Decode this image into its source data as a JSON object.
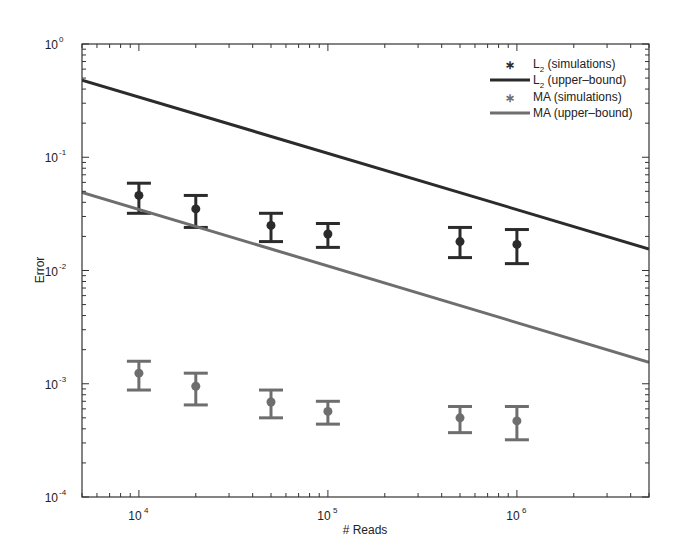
{
  "chart_data": {
    "type": "scatter",
    "title": "",
    "xlabel": "# Reads",
    "ylabel": "Error",
    "xscale": "log",
    "yscale": "log",
    "xlim": [
      5000,
      5000000
    ],
    "ylim": [
      0.0001,
      1
    ],
    "grid": false,
    "legend_position": "upper right",
    "x_ticks": [
      {
        "value": 10000,
        "base": "10",
        "exp": "4"
      },
      {
        "value": 100000,
        "base": "10",
        "exp": "5"
      },
      {
        "value": 1000000,
        "base": "10",
        "exp": "6"
      }
    ],
    "y_ticks": [
      {
        "value": 1,
        "base": "10",
        "exp": "0"
      },
      {
        "value": 0.1,
        "base": "10",
        "exp": "-1"
      },
      {
        "value": 0.01,
        "base": "10",
        "exp": "-2"
      },
      {
        "value": 0.001,
        "base": "10",
        "exp": "-3"
      },
      {
        "value": 0.0001,
        "base": "10",
        "exp": "-4"
      }
    ],
    "series": [
      {
        "name": "L2 (simulations)",
        "label_main": "L",
        "label_sub": "2",
        "label_rest": " (simulations)",
        "kind": "errorbar",
        "color": "#2b2b2b",
        "x": [
          10000,
          20000,
          50000,
          100000,
          500000,
          1000000
        ],
        "y": [
          0.046,
          0.035,
          0.025,
          0.021,
          0.018,
          0.017
        ],
        "y_lower": [
          0.032,
          0.024,
          0.018,
          0.016,
          0.013,
          0.0115
        ],
        "y_upper": [
          0.059,
          0.046,
          0.032,
          0.026,
          0.024,
          0.023
        ]
      },
      {
        "name": "L2 (upper-bound)",
        "label_main": "L",
        "label_sub": "2",
        "label_rest": " (upper–bound)",
        "kind": "line",
        "color": "#2b2b2b",
        "x": [
          5000,
          5000000
        ],
        "y": [
          0.48,
          0.0155
        ]
      },
      {
        "name": "MA (simulations)",
        "label_main": "MA (simulations)",
        "label_sub": "",
        "label_rest": "",
        "kind": "errorbar",
        "color": "#6e6e6e",
        "x": [
          10000,
          20000,
          50000,
          100000,
          500000,
          1000000
        ],
        "y": [
          0.00124,
          0.00095,
          0.00069,
          0.00057,
          0.0005,
          0.00047
        ],
        "y_lower": [
          0.00088,
          0.00065,
          0.0005,
          0.00044,
          0.00037,
          0.00032
        ],
        "y_upper": [
          0.00158,
          0.00124,
          0.00088,
          0.0007,
          0.00063,
          0.00063
        ]
      },
      {
        "name": "MA (upper-bound)",
        "label_main": "MA (upper–bound)",
        "label_sub": "",
        "label_rest": "",
        "kind": "line",
        "color": "#6e6e6e",
        "x": [
          5000,
          5000000
        ],
        "y": [
          0.049,
          0.00155
        ]
      }
    ]
  }
}
